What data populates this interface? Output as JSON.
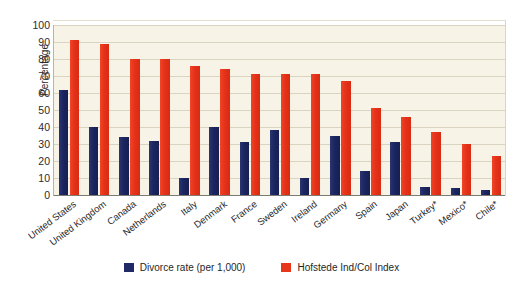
{
  "chart_data": {
    "type": "bar",
    "title": "",
    "subtitle": "",
    "xlabel": "",
    "ylabel": "Percentage",
    "ylim": [
      0,
      100
    ],
    "ytick_step": 10,
    "yticks": [
      100,
      90,
      80,
      70,
      60,
      50,
      40,
      30,
      20,
      10,
      0
    ],
    "grid": true,
    "legend_position": "bottom-center",
    "orientation": "vertical",
    "categories": [
      "United States",
      "United Kingdom",
      "Canada",
      "Netherlands",
      "Italy",
      "Denmark",
      "France",
      "Sweden",
      "Ireland",
      "Germany",
      "Spain",
      "Japan",
      "Turkey*",
      "Mexico*",
      "Chile*"
    ],
    "series": [
      {
        "name": "Divorce rate (per 1,000)",
        "color": "#1f2a66",
        "values": [
          62,
          40,
          34,
          32,
          10,
          40,
          31,
          38,
          10,
          35,
          14,
          31,
          5,
          4,
          3
        ]
      },
      {
        "name": "Hofstede Ind/Col Index",
        "color": "#e8361a",
        "values": [
          91,
          89,
          80,
          80,
          76,
          74,
          71,
          71,
          71,
          67,
          51,
          46,
          37,
          30,
          23
        ]
      }
    ]
  },
  "axes": {
    "y_title": "Percentage"
  },
  "legend": {
    "items": [
      {
        "label": "Divorce rate (per 1,000)",
        "swatch": "blue"
      },
      {
        "label": "Hofstede Ind/Col Index",
        "swatch": "red"
      }
    ]
  },
  "colors": {
    "series_blue": "#1f2a66",
    "series_red": "#e8361a",
    "plot_background": "#f7f3e7",
    "page_background": "#ffffff",
    "gridline": "#d9d3c0"
  }
}
